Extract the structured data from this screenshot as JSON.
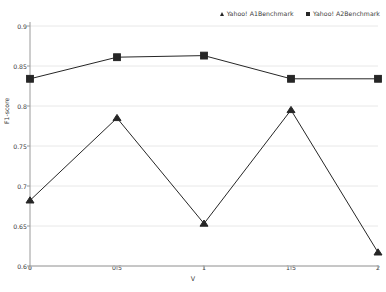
{
  "chart_data": {
    "type": "line",
    "title": "",
    "xlabel": "V",
    "ylabel": "F1-score",
    "x": [
      0,
      0.5,
      1,
      1.5,
      2
    ],
    "xticklabels": [
      "0",
      "0.5",
      "1",
      "1.5",
      "2"
    ],
    "yticklabels": [
      "0.6",
      "0.65",
      "0.7",
      "0.75",
      "0.8",
      "0.85",
      "0.9"
    ],
    "yticks": [
      0.6,
      0.65,
      0.7,
      0.75,
      0.8,
      0.85,
      0.9
    ],
    "xlim": [
      0,
      2
    ],
    "ylim": [
      0.6,
      0.9
    ],
    "grid": true,
    "grid_axis": "y",
    "legend_position": "top-right",
    "series": [
      {
        "name": "Yahoo! A1Benchmark",
        "marker": "triangle",
        "color": "#262626",
        "values": [
          0.682,
          0.785,
          0.653,
          0.795,
          0.617
        ]
      },
      {
        "name": "Yahoo! A2Benchmark",
        "marker": "square",
        "color": "#262626",
        "values": [
          0.834,
          0.861,
          0.863,
          0.834,
          0.834
        ]
      }
    ]
  },
  "legend": {
    "entries": [
      {
        "label": "Yahoo! A1Benchmark",
        "marker": "triangle-marker"
      },
      {
        "label": "Yahoo! A2Benchmark",
        "marker": "square-marker"
      }
    ]
  },
  "axes": {
    "x_title": "V",
    "y_title": "F1-score"
  },
  "colors": {
    "line": "#262626",
    "grid": "#e8e8e8",
    "axis": "#9a9a9a",
    "text": "#3a3a3a"
  }
}
